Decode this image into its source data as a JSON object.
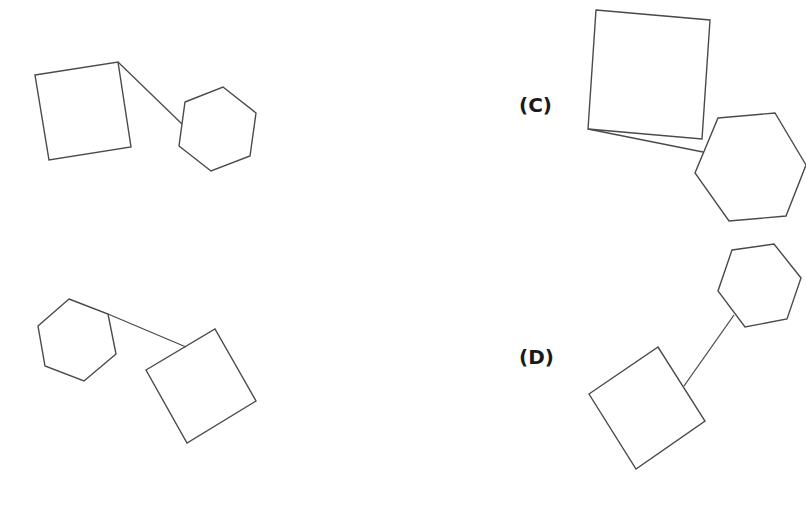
{
  "figure": {
    "stroke_color": "#4a4a4a",
    "label_color": "#1a1a1a",
    "panels": [
      {
        "label": "(A)",
        "label_visible": ")",
        "square": "35,75 118,62 131,147 49,160",
        "hexagon": "185,102 223,87 256,113 250,156 211,171 179,146",
        "connector": {
          "x1": 118,
          "y1": 62,
          "x2": 182,
          "y2": 124
        }
      },
      {
        "label": "(B)",
        "label_visible": ")",
        "hexagon": "69,299 108,314 116,354 84,381 45,366 38,326",
        "square": "146,370 215,329 256,401 187,443",
        "connector": {
          "x1": 108,
          "y1": 314,
          "x2": 186,
          "y2": 347
        }
      },
      {
        "label": "(C)",
        "square": "596,10 710,20 702,139 588,129",
        "hexagon": "718,118 775,113 806,165 786,216 729,221 695,173",
        "connector": {
          "x1": 588,
          "y1": 129,
          "x2": 703,
          "y2": 152
        }
      },
      {
        "label": "(D)",
        "hexagon": "732,250 774,244 801,278 787,319 745,327 718,291",
        "square": "589,394 658,347 705,421 636,469",
        "connector": {
          "x1": 734,
          "y1": 315,
          "x2": 684,
          "y2": 386
        }
      }
    ]
  }
}
